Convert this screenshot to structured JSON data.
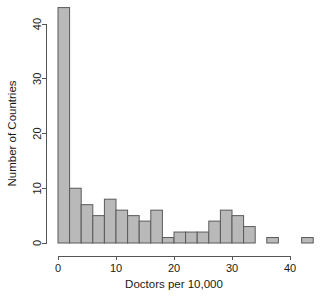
{
  "chart_data": {
    "type": "bar",
    "title": "",
    "subtitle": "",
    "xlabel": "Doctors per 10,000",
    "ylabel": "Number of Countries",
    "xlim": [
      0,
      44
    ],
    "ylim": [
      0,
      44
    ],
    "xticks": [
      0,
      10,
      20,
      30,
      40
    ],
    "xtick_labels": [
      "0",
      "10",
      "20",
      "30",
      "40"
    ],
    "yticks": [
      0,
      10,
      20,
      30,
      40
    ],
    "ytick_labels": [
      "0",
      "10",
      "20",
      "30",
      "40"
    ],
    "grid": false,
    "legend": null,
    "bin_width": 2,
    "bin_edges": [
      0,
      2,
      4,
      6,
      8,
      10,
      12,
      14,
      16,
      18,
      20,
      22,
      24,
      26,
      28,
      30,
      32,
      34,
      36,
      38,
      40,
      42,
      44
    ],
    "categories": [
      "0-2",
      "2-4",
      "4-6",
      "6-8",
      "8-10",
      "10-12",
      "12-14",
      "14-16",
      "16-18",
      "18-20",
      "20-22",
      "22-24",
      "24-26",
      "26-28",
      "28-30",
      "30-32",
      "32-34",
      "34-36",
      "36-38",
      "38-40",
      "40-42",
      "42-44"
    ],
    "values": [
      43,
      10,
      7,
      5,
      8,
      6,
      5,
      4,
      6,
      1,
      2,
      2,
      2,
      4,
      6,
      5,
      3,
      0,
      1,
      0,
      0,
      1
    ],
    "bar_fill_color": "#b9b9b9",
    "bar_border_color": "#5a5a5a",
    "axis_color": "#555555",
    "background_color": "#ffffff"
  },
  "axes": {
    "x_title": "Doctors per 10,000",
    "y_title": "Number of Countries"
  }
}
